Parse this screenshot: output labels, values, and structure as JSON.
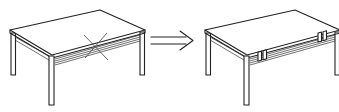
{
  "diagram": {
    "type": "assembly-instruction",
    "panels": [
      {
        "id": "before",
        "label": "Table without rail connectors (incorrect)",
        "marker": "x-mark-icon",
        "marker_meaning": "incorrect"
      },
      {
        "id": "after",
        "label": "Table with rail connectors installed (correct)",
        "marker": "connector-clips",
        "clip_count": 2
      }
    ],
    "arrow": {
      "direction": "right",
      "style": "double-line open arrow"
    },
    "colors": {
      "line": "#222222",
      "background": "#ffffff"
    }
  }
}
